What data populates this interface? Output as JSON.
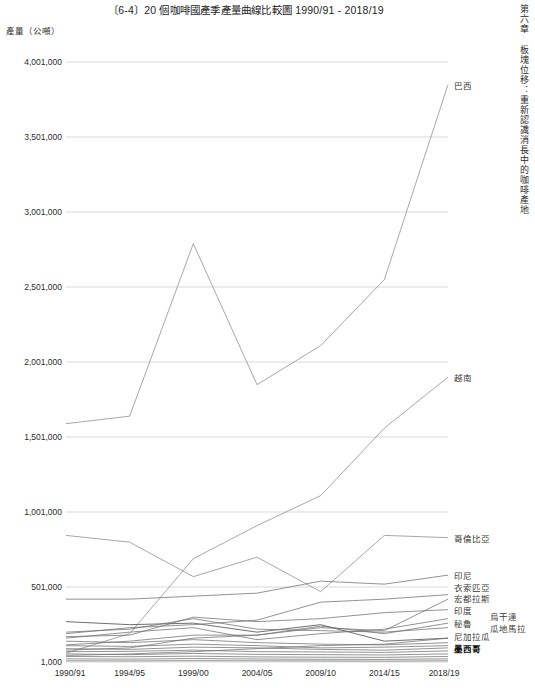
{
  "page": {
    "title": "〔6-4〕20 個咖啡國產季產量曲線比較圖 1990/91 - 2018/19",
    "running_head": "第六章 板塊位移：重新認識消長中的咖啡產地",
    "y_axis_caption": "產量（公噸）"
  },
  "chart_data": {
    "type": "line",
    "title": "〔6-4〕20 個咖啡國產季產量曲線比較圖 1990/91 - 2018/19",
    "xlabel": "",
    "ylabel": "產量（公噸）",
    "grid": true,
    "legend_position": "right-end-of-line",
    "categories": [
      "1990/91",
      "1994/95",
      "1999/00",
      "2004/05",
      "2009/10",
      "2014/15",
      "2018/19"
    ],
    "ylim": [
      1000,
      4001000
    ],
    "yticks": [
      1000,
      501000,
      1001000,
      1501000,
      2001000,
      2501000,
      3001000,
      3501000,
      4001000
    ],
    "ytick_labels": [
      "1,000",
      "501,000",
      "1,001,000",
      "1,501,000",
      "2,001,000",
      "2,501,000",
      "3,001,000",
      "3,501,000",
      "4,001,000"
    ],
    "series": [
      {
        "name": "巴西",
        "label_style": "normal",
        "values": [
          1590000,
          1640000,
          2790000,
          1850000,
          2110000,
          2550000,
          3850000
        ]
      },
      {
        "name": "越南",
        "label_style": "normal",
        "values": [
          60000,
          190000,
          690000,
          910000,
          1110000,
          1560000,
          1900000
        ]
      },
      {
        "name": "哥倫比亞",
        "label_style": "normal",
        "values": [
          845000,
          800000,
          570000,
          700000,
          470000,
          845000,
          830000
        ]
      },
      {
        "name": "印尼",
        "label_style": "normal",
        "values": [
          420000,
          420000,
          440000,
          460000,
          540000,
          520000,
          580000
        ]
      },
      {
        "name": "衣索匹亞",
        "label_style": "normal",
        "values": [
          190000,
          230000,
          250000,
          280000,
          400000,
          420000,
          450000
        ]
      },
      {
        "name": "宏都拉斯",
        "label_style": "normal",
        "values": [
          115000,
          140000,
          180000,
          180000,
          230000,
          210000,
          420000
        ]
      },
      {
        "name": "印度",
        "label_style": "normal",
        "values": [
          170000,
          180000,
          300000,
          270000,
          290000,
          330000,
          350000
        ]
      },
      {
        "name": "烏干達",
        "label_style": "normal",
        "values": [
          160000,
          200000,
          230000,
          150000,
          190000,
          220000,
          290000
        ]
      },
      {
        "name": "秘魯",
        "label_style": "normal",
        "values": [
          80000,
          95000,
          160000,
          180000,
          240000,
          190000,
          260000
        ]
      },
      {
        "name": "瓜地馬拉",
        "label_style": "normal",
        "values": [
          200000,
          220000,
          290000,
          220000,
          210000,
          200000,
          230000
        ]
      },
      {
        "name": "尼加拉瓜",
        "label_style": "normal",
        "values": [
          45000,
          55000,
          70000,
          90000,
          110000,
          120000,
          160000
        ]
      },
      {
        "name": "墨西哥",
        "label_style": "bold",
        "values": [
          270000,
          250000,
          260000,
          200000,
          250000,
          140000,
          160000
        ]
      },
      {
        "name": "series-13",
        "label_style": "none",
        "values": [
          140000,
          130000,
          150000,
          130000,
          120000,
          115000,
          130000
        ]
      },
      {
        "name": "series-14",
        "label_style": "none",
        "values": [
          110000,
          105000,
          120000,
          110000,
          95000,
          100000,
          110000
        ]
      },
      {
        "name": "series-15",
        "label_style": "none",
        "values": [
          90000,
          85000,
          100000,
          95000,
          85000,
          80000,
          95000
        ]
      },
      {
        "name": "series-16",
        "label_style": "none",
        "values": [
          70000,
          72000,
          80000,
          70000,
          68000,
          65000,
          75000
        ]
      },
      {
        "name": "series-17",
        "label_style": "none",
        "values": [
          55000,
          50000,
          58000,
          52000,
          50000,
          48000,
          55000
        ]
      },
      {
        "name": "series-18",
        "label_style": "none",
        "values": [
          38000,
          36000,
          40000,
          35000,
          33000,
          32000,
          38000
        ]
      },
      {
        "name": "series-19",
        "label_style": "none",
        "values": [
          22000,
          20000,
          24000,
          21000,
          19000,
          18000,
          22000
        ]
      },
      {
        "name": "series-20",
        "label_style": "none",
        "values": [
          9000,
          8000,
          10000,
          9000,
          8000,
          7000,
          9000
        ]
      }
    ],
    "end_labels": [
      {
        "text": "巴西",
        "value": 3850000,
        "column": 1,
        "style": "normal"
      },
      {
        "text": "越南",
        "value": 1900000,
        "column": 1,
        "style": "normal"
      },
      {
        "text": "哥倫比亞",
        "value": 830000,
        "column": 1,
        "style": "normal"
      },
      {
        "text": "印尼",
        "value": 580000,
        "column": 1,
        "style": "normal"
      },
      {
        "text": "衣索匹亞",
        "value": 450000,
        "column": 1,
        "style": "normal"
      },
      {
        "text": "宏都拉斯",
        "value": 420000,
        "column": 1,
        "style": "normal"
      },
      {
        "text": "印度",
        "value": 350000,
        "column": 1,
        "style": "normal"
      },
      {
        "text": "秘魯",
        "value": 260000,
        "column": 1,
        "style": "normal"
      },
      {
        "text": "尼加拉瓜",
        "value": 160000,
        "column": 1,
        "style": "normal"
      },
      {
        "text": "墨西哥",
        "value": 95000,
        "column": 1,
        "style": "bold"
      },
      {
        "text": "烏干達",
        "value": 290000,
        "column": 2,
        "style": "normal"
      },
      {
        "text": "瓜地馬拉",
        "value": 230000,
        "column": 2,
        "style": "normal"
      }
    ]
  },
  "style": {
    "line_color_major": "#8a8a8a",
    "line_color_minor": "#6f6f6f",
    "grid_color": "#cfcfcf",
    "text_color": "#2b2b2b"
  }
}
